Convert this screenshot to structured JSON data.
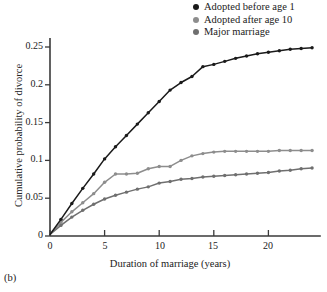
{
  "figure": {
    "panel_label": "(b)"
  },
  "legend": {
    "position": "top-right",
    "items": [
      {
        "label": "Adopted before age 1",
        "color": "#1a1a1a",
        "marker": "legend-dot-icon"
      },
      {
        "label": "Adopted after age 10",
        "color": "#8d8d8d",
        "marker": "legend-dot-icon"
      },
      {
        "label": "Major marriage",
        "color": "#6f6f6f",
        "marker": "legend-dot-icon"
      }
    ]
  },
  "axes": {
    "xlabel": "Duration of marriage (years)",
    "ylabel": "Cumulative probability of divorce",
    "xticks": [
      "0",
      "5",
      "10",
      "15",
      "20"
    ],
    "yticks": [
      "0",
      "0.05",
      "0.1",
      "0.15",
      "0.2",
      "0.25"
    ]
  },
  "chart_data": {
    "type": "line",
    "title": "",
    "subtitle": "",
    "xlabel": "Duration of marriage (years)",
    "ylabel": "Cumulative probability of divorce",
    "xlim": [
      0,
      24.8
    ],
    "ylim": [
      0,
      0.262
    ],
    "xticks": [
      0,
      5,
      10,
      15,
      20
    ],
    "yticks": [
      0,
      0.05,
      0.1,
      0.15,
      0.2,
      0.25
    ],
    "grid": false,
    "legend_position": "top-right",
    "markers": true,
    "annotations": [
      "(b)"
    ],
    "x": [
      0,
      1,
      2,
      3,
      4,
      5,
      6,
      7,
      8,
      9,
      10,
      11,
      12,
      13,
      14,
      15,
      16,
      17,
      18,
      19,
      20,
      21,
      22,
      23,
      24
    ],
    "series": [
      {
        "name": "Adopted before age 1",
        "color": "#1a1a1a",
        "values": [
          0.002,
          0.022,
          0.043,
          0.063,
          0.082,
          0.102,
          0.118,
          0.133,
          0.148,
          0.163,
          0.178,
          0.193,
          0.203,
          0.211,
          0.224,
          0.227,
          0.231,
          0.235,
          0.238,
          0.241,
          0.243,
          0.245,
          0.247,
          0.248,
          0.249
        ]
      },
      {
        "name": "Adopted after age 10",
        "color": "#8d8d8d",
        "values": [
          0.002,
          0.018,
          0.032,
          0.044,
          0.056,
          0.071,
          0.082,
          0.082,
          0.083,
          0.089,
          0.092,
          0.092,
          0.1,
          0.106,
          0.109,
          0.111,
          0.112,
          0.112,
          0.112,
          0.112,
          0.112,
          0.113,
          0.113,
          0.113,
          0.113
        ]
      },
      {
        "name": "Major marriage",
        "color": "#6f6f6f",
        "values": [
          0.002,
          0.014,
          0.025,
          0.034,
          0.042,
          0.049,
          0.054,
          0.058,
          0.062,
          0.065,
          0.07,
          0.072,
          0.075,
          0.076,
          0.078,
          0.079,
          0.08,
          0.081,
          0.082,
          0.083,
          0.084,
          0.086,
          0.087,
          0.089,
          0.09
        ]
      }
    ]
  }
}
